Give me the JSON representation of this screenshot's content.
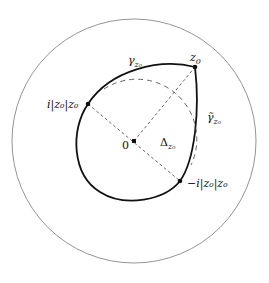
{
  "diagram": {
    "labels": {
      "z0": {
        "base": "z",
        "sub": "0"
      },
      "gamma": {
        "base": "γ",
        "sub": "z₀"
      },
      "gamma_tilde": {
        "base": "γ̃",
        "sub": "z₀"
      },
      "i_point": "i|z₀|z₀",
      "neg_i_point": "−i|z₀|z₀",
      "origin": "0",
      "delta": {
        "base": "Δ",
        "sub": "z₀"
      }
    },
    "colors": {
      "outer_circle": "#888888",
      "curve": "#111111",
      "dashed": "#555555"
    }
  }
}
